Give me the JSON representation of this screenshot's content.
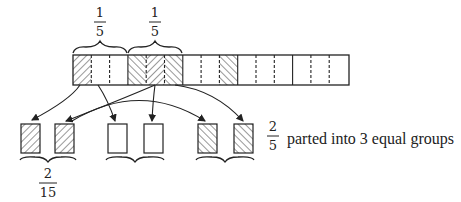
{
  "diagram": {
    "top_labels": [
      {
        "numerator": "1",
        "denominator": "5"
      },
      {
        "numerator": "1",
        "denominator": "5"
      }
    ],
    "bar": {
      "cells": 15,
      "groups": 5,
      "shaded_cells": [
        0,
        3,
        4,
        5,
        8
      ],
      "hatch_left_cells": [
        0,
        4
      ],
      "hatch_right_cells": [
        3,
        5,
        8
      ]
    },
    "parts": [
      {
        "boxes": [
          "hatch-left",
          "hatch-left"
        ]
      },
      {
        "boxes": [
          "empty",
          "empty"
        ]
      },
      {
        "boxes": [
          "hatch-right",
          "hatch-right"
        ]
      }
    ],
    "bottom_label": {
      "numerator": "2",
      "denominator": "15"
    },
    "side_label": {
      "numerator": "2",
      "denominator": "5",
      "text": "parted into 3 equal groups"
    },
    "colors": {
      "line": "#222222",
      "background": "#ffffff"
    }
  }
}
